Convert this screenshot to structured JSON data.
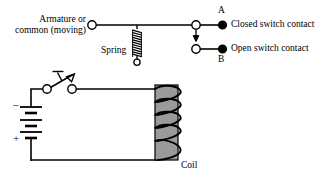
{
  "diagram": {
    "labels": {
      "armature_line1": "Armature or",
      "armature_line2": "common (moving)",
      "spring": "Spring",
      "coil": "Coil",
      "contact_a": "A",
      "contact_b": "B",
      "closed_contact": "Closed switch contact",
      "open_contact": "Open switch contact",
      "battery_negative": "–",
      "battery_positive": "+"
    },
    "colors": {
      "stroke": "#000000",
      "background": "#ffffff",
      "core_fill": "#9a9a9a",
      "core_stroke": "#000000",
      "terminal_open_fill": "#ffffff",
      "terminal_closed_fill": "#000000"
    },
    "components": [
      {
        "name": "armature-bar",
        "type": "wire",
        "from": [
          92,
          25
        ],
        "to": [
          196,
          25
        ]
      },
      {
        "name": "armature-terminal",
        "type": "open-terminal",
        "cx": 92,
        "cy": 25,
        "r": 4.2
      },
      {
        "name": "pivot-terminal",
        "type": "open-terminal",
        "cx": 196,
        "cy": 25,
        "r": 4.2
      },
      {
        "name": "spring",
        "type": "coil-spring",
        "x": 137,
        "y_top": 27,
        "y_bottom": 58,
        "turns": 7,
        "width": 9
      },
      {
        "name": "spring-terminal",
        "type": "open-terminal",
        "cx": 137,
        "cy": 62,
        "r": 3.2
      },
      {
        "name": "contact-a",
        "type": "closed-contact",
        "open_cx": 196,
        "closed_cx": 222,
        "cy": 25,
        "label": "A"
      },
      {
        "name": "contact-b",
        "type": "open-contact",
        "open_cx": 196,
        "closed_cx": 222,
        "cy": 49,
        "label": "B"
      },
      {
        "name": "pivot-arrow",
        "type": "arrow-down",
        "x": 196,
        "y_top": 29,
        "y_bottom": 40
      },
      {
        "name": "push-switch",
        "type": "spst-push-button",
        "left_terminal": [
          47,
          89
        ],
        "right_terminal": [
          72,
          89
        ]
      },
      {
        "name": "battery",
        "type": "multi-cell-battery",
        "x": 31,
        "y_top": 103,
        "y_bottom": 143,
        "cells": 2
      },
      {
        "name": "relay-core",
        "type": "rect",
        "x": 155,
        "y": 85,
        "w": 23,
        "h": 75
      },
      {
        "name": "relay-coil-windings",
        "type": "helix",
        "turns": 4
      },
      {
        "name": "wire-switch-to-coil",
        "type": "wire",
        "from": [
          72,
          89
        ],
        "to": [
          163,
          89
        ]
      },
      {
        "name": "wire-battery-to-switch",
        "type": "wire",
        "from": [
          31,
          103
        ],
        "to": [
          31,
          89
        ],
        "to2": [
          47,
          89
        ]
      },
      {
        "name": "wire-battery-bottom",
        "type": "wire",
        "from": [
          31,
          143
        ],
        "to": [
          31,
          160
        ],
        "to2": [
          163,
          160
        ]
      }
    ]
  }
}
